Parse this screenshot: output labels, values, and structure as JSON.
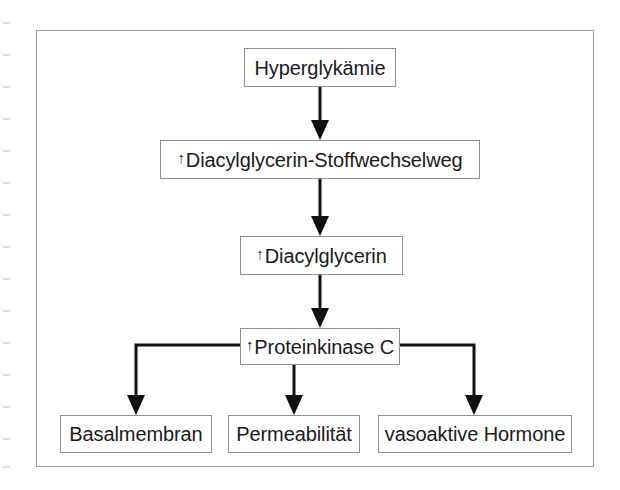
{
  "page": {
    "background_color": "#ffffff",
    "frame_color": "#9a9a9a",
    "ink_color": "#1a1a1a"
  },
  "diagram": {
    "type": "flowchart",
    "title": "",
    "language": "de",
    "up_arrow_glyph": "↑",
    "nodes": [
      {
        "id": "hyperglykaemie",
        "label": "Hyperglykämie",
        "increase_marker": false,
        "level": 0
      },
      {
        "id": "dag-pathway",
        "label": "Diacylglycerin-Stoffwechselweg",
        "increase_marker": true,
        "level": 1
      },
      {
        "id": "dag",
        "label": "Diacylglycerin",
        "increase_marker": true,
        "level": 2
      },
      {
        "id": "pkc",
        "label": "Proteinkinase C",
        "increase_marker": true,
        "level": 3
      },
      {
        "id": "basalmembran",
        "label": "Basalmembran",
        "increase_marker": false,
        "level": 4
      },
      {
        "id": "permeabilitaet",
        "label": "Permeabilität",
        "increase_marker": false,
        "level": 4
      },
      {
        "id": "hormone",
        "label": "vasoaktive Hormone",
        "increase_marker": false,
        "level": 4
      }
    ],
    "edges": [
      {
        "from": "hyperglykaemie",
        "to": "dag-pathway",
        "style": "arrow-down"
      },
      {
        "from": "dag-pathway",
        "to": "dag",
        "style": "arrow-down"
      },
      {
        "from": "dag",
        "to": "pkc",
        "style": "arrow-down"
      },
      {
        "from": "pkc",
        "to": "basalmembran",
        "style": "elbow-left-down"
      },
      {
        "from": "pkc",
        "to": "permeabilitaet",
        "style": "arrow-down"
      },
      {
        "from": "pkc",
        "to": "hormone",
        "style": "elbow-right-down"
      }
    ]
  }
}
